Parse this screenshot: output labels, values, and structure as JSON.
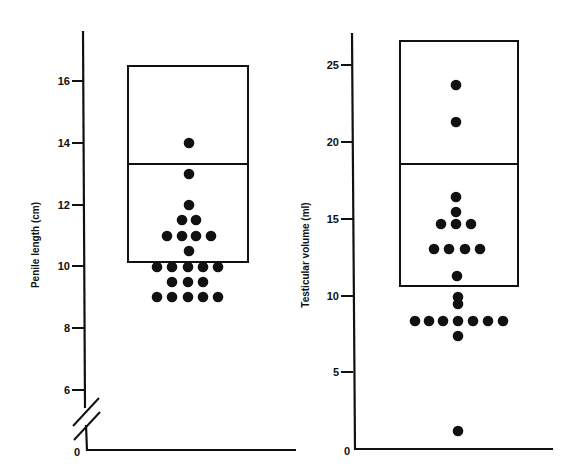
{
  "chart_data": [
    {
      "type": "scatter",
      "subtype": "dot-plot-with-reference-box",
      "title": "",
      "xlabel": "",
      "ylabel": "Penile length (cm)",
      "ylim": [
        0,
        17.5
      ],
      "axis_break": {
        "from": 0,
        "to": 5.5
      },
      "yticks": [
        0,
        6,
        8,
        10,
        12,
        14,
        16
      ],
      "ytick_labels": [
        "0",
        "6",
        "8",
        "10",
        "12",
        "14",
        "16"
      ],
      "grid": false,
      "reference_box": {
        "low": 10.1,
        "median": 13.3,
        "high": 16.5
      },
      "points": [
        14.0,
        13.0,
        12.0,
        11.5,
        11.5,
        11.0,
        11.0,
        11.0,
        11.0,
        10.5,
        10.0,
        10.0,
        10.0,
        10.0,
        10.0,
        9.5,
        9.5,
        9.5,
        9.0,
        9.0,
        9.0,
        9.0,
        9.0
      ],
      "n": 23
    },
    {
      "type": "scatter",
      "subtype": "dot-plot-with-reference-box",
      "title": "",
      "xlabel": "",
      "ylabel": "Testicular volume (ml)",
      "ylim": [
        0,
        27.5
      ],
      "yticks": [
        0,
        5,
        10,
        15,
        20,
        25
      ],
      "ytick_labels": [
        "0",
        "5",
        "10",
        "15",
        "20",
        "25"
      ],
      "grid": false,
      "reference_box": {
        "low": 10.6,
        "median": 18.6,
        "high": 26.6
      },
      "points": [
        23.6,
        21.2,
        16.5,
        15.5,
        14.7,
        14.7,
        14.7,
        13.0,
        13.0,
        13.0,
        13.0,
        11.3,
        9.9,
        9.5,
        8.4,
        8.4,
        8.4,
        8.4,
        8.4,
        8.4,
        8.4,
        7.4,
        1.2
      ],
      "n": 23
    }
  ],
  "left_chart": {
    "ylabel": "Penile length (cm)",
    "ticks": [
      {
        "label": "16",
        "y": 81
      },
      {
        "label": "14",
        "y": 143
      },
      {
        "label": "12",
        "y": 205
      },
      {
        "label": "10",
        "y": 266
      },
      {
        "label": "8",
        "y": 328
      },
      {
        "label": "6",
        "y": 390
      }
    ],
    "zero_label": "0",
    "box": {
      "x": 128,
      "w": 120,
      "top": 66,
      "median": 164,
      "bottom": 262
    },
    "dots": [
      [
        189,
        143
      ],
      [
        189,
        174
      ],
      [
        189,
        205
      ],
      [
        182,
        220
      ],
      [
        196,
        220
      ],
      [
        167,
        236
      ],
      [
        182,
        236
      ],
      [
        196,
        236
      ],
      [
        211,
        236
      ],
      [
        189,
        251
      ],
      [
        157,
        267
      ],
      [
        172,
        267
      ],
      [
        188,
        267
      ],
      [
        203,
        267
      ],
      [
        218,
        267
      ],
      [
        172,
        282
      ],
      [
        188,
        282
      ],
      [
        203,
        282
      ],
      [
        157,
        297
      ],
      [
        172,
        297
      ],
      [
        188,
        297
      ],
      [
        203,
        297
      ],
      [
        218,
        297
      ]
    ]
  },
  "right_chart": {
    "ylabel": "Testicular volume (ml)",
    "ticks": [
      {
        "label": "25",
        "y": 65
      },
      {
        "label": "20",
        "y": 142
      },
      {
        "label": "15",
        "y": 219
      },
      {
        "label": "10",
        "y": 296
      },
      {
        "label": "5",
        "y": 372
      }
    ],
    "zero_label": "0",
    "box": {
      "x": 400,
      "w": 118,
      "top": 41,
      "median": 164,
      "bottom": 286
    },
    "dots": [
      [
        456,
        85
      ],
      [
        456,
        122
      ],
      [
        456,
        197
      ],
      [
        456,
        212
      ],
      [
        441,
        224
      ],
      [
        456,
        224
      ],
      [
        471,
        224
      ],
      [
        434,
        249
      ],
      [
        449,
        249
      ],
      [
        465,
        249
      ],
      [
        480,
        249
      ],
      [
        457,
        276
      ],
      [
        458,
        297
      ],
      [
        458,
        304
      ],
      [
        415,
        321
      ],
      [
        429,
        321
      ],
      [
        443,
        321
      ],
      [
        458,
        321
      ],
      [
        473,
        321
      ],
      [
        488,
        321
      ],
      [
        503,
        321
      ],
      [
        458,
        336
      ],
      [
        458,
        431
      ]
    ]
  },
  "colors": {
    "ink": "#111111",
    "background": "#ffffff"
  }
}
